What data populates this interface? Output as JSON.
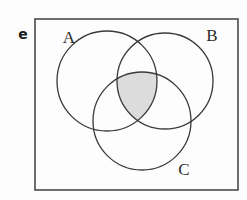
{
  "figure": {
    "panel_label": "e",
    "type": "venn-diagram",
    "background_color": "#fdfdfd"
  },
  "universe": {
    "name": "universal-set-rectangle",
    "x": 35,
    "y": 19,
    "width": 203,
    "height": 171,
    "stroke_color": "#4a4a4a",
    "stroke_width": 1.6,
    "fill_color": "none"
  },
  "sets": [
    {
      "id": "A",
      "label": "A",
      "cx": 107,
      "cy": 81,
      "r": 50,
      "stroke_color": "#3a3a3a",
      "stroke_width": 1.3,
      "label_x": 69,
      "label_y": 38
    },
    {
      "id": "B",
      "label": "B",
      "cx": 165,
      "cy": 81,
      "r": 48,
      "stroke_color": "#3a3a3a",
      "stroke_width": 1.3,
      "label_x": 212,
      "label_y": 36
    },
    {
      "id": "C",
      "label": "C",
      "cx": 142,
      "cy": 121,
      "r": 49,
      "stroke_color": "#3a3a3a",
      "stroke_width": 1.3,
      "label_x": 184,
      "label_y": 170
    }
  ],
  "shaded_region": {
    "name": "triple-intersection",
    "expression": "A ∩ B ∩ C",
    "fill_color": "#dcdcdc",
    "stroke_color": "#3a3a3a",
    "description": "intersection of all three sets shaded light gray"
  }
}
